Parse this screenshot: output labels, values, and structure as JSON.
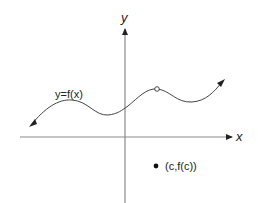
{
  "diagram": {
    "axes": {
      "x_label": "x",
      "y_label": "y"
    },
    "curve_label": "y=f(x)",
    "point_label": "(c,f(c))",
    "colors": {
      "axis": "#8a8a8a",
      "curve": "#444444",
      "text": "#222222"
    }
  }
}
